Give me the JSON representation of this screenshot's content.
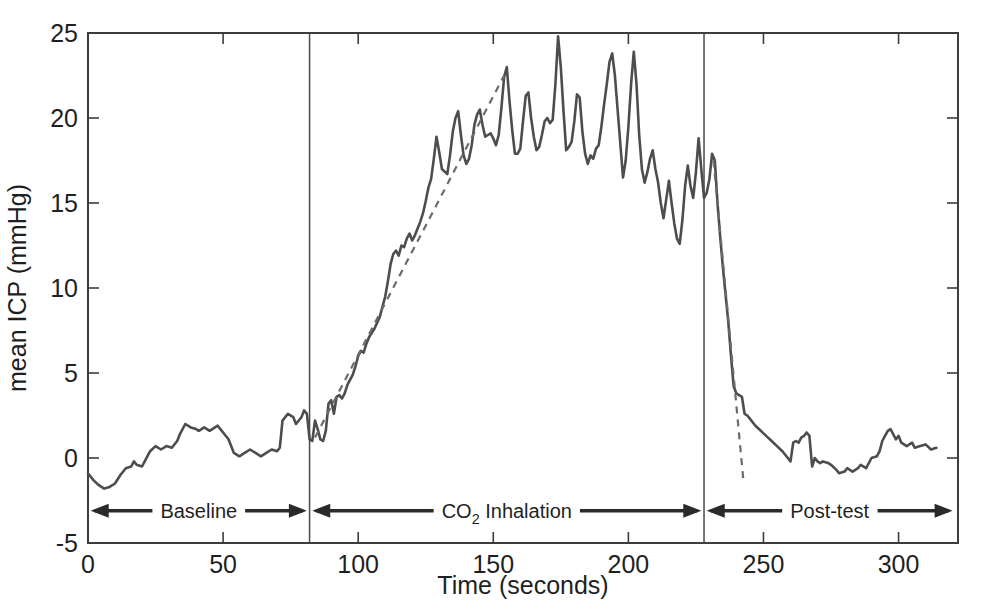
{
  "figure": {
    "background": "#ffffff",
    "line_color": "#4d4d4d",
    "trend_color": "#6b6b6b",
    "axis_color": "#3d3d3d",
    "text_color": "#1f1f1f"
  },
  "chart_data": {
    "type": "line",
    "title": "",
    "xlabel": "Time (seconds)",
    "ylabel": "mean ICP (mmHg)",
    "xlim": [
      0,
      322
    ],
    "ylim": [
      -5,
      25
    ],
    "x_ticks": [
      0,
      50,
      100,
      150,
      200,
      250,
      300
    ],
    "y_ticks": [
      -5,
      0,
      5,
      10,
      15,
      20,
      25
    ],
    "grid": false,
    "box": true,
    "legend": "none",
    "phase_dividers": [
      82,
      228
    ],
    "series": [
      {
        "name": "mean ICP",
        "style": "solid",
        "points": [
          [
            0,
            -0.9
          ],
          [
            2,
            -1.3
          ],
          [
            4,
            -1.6
          ],
          [
            6,
            -1.8
          ],
          [
            8,
            -1.7
          ],
          [
            10,
            -1.5
          ],
          [
            12,
            -1.0
          ],
          [
            14,
            -0.6
          ],
          [
            16,
            -0.5
          ],
          [
            17,
            -0.2
          ],
          [
            18,
            -0.4
          ],
          [
            20,
            -0.5
          ],
          [
            21,
            -0.2
          ],
          [
            23,
            0.4
          ],
          [
            25,
            0.7
          ],
          [
            27,
            0.5
          ],
          [
            29,
            0.7
          ],
          [
            31,
            0.6
          ],
          [
            33,
            1.0
          ],
          [
            34,
            1.4
          ],
          [
            36,
            2.0
          ],
          [
            38,
            1.8
          ],
          [
            40,
            1.7
          ],
          [
            41,
            1.6
          ],
          [
            43,
            1.8
          ],
          [
            45,
            1.6
          ],
          [
            46,
            1.7
          ],
          [
            48,
            1.9
          ],
          [
            49,
            1.7
          ],
          [
            50,
            1.5
          ],
          [
            52,
            1.1
          ],
          [
            54,
            0.3
          ],
          [
            56,
            0.1
          ],
          [
            58,
            0.3
          ],
          [
            60,
            0.5
          ],
          [
            62,
            0.3
          ],
          [
            64,
            0.1
          ],
          [
            66,
            0.3
          ],
          [
            68,
            0.5
          ],
          [
            70,
            0.4
          ],
          [
            71,
            0.6
          ],
          [
            72,
            2.2
          ],
          [
            74,
            2.6
          ],
          [
            76,
            2.4
          ],
          [
            77,
            2.0
          ],
          [
            79,
            2.4
          ],
          [
            80,
            2.8
          ],
          [
            81,
            2.6
          ],
          [
            82,
            1.1
          ],
          [
            83,
            1.0
          ],
          [
            84,
            2.2
          ],
          [
            85,
            1.7
          ],
          [
            86,
            1.1
          ],
          [
            87,
            1.0
          ],
          [
            88,
            1.6
          ],
          [
            89,
            3.2
          ],
          [
            90,
            3.4
          ],
          [
            91,
            2.6
          ],
          [
            92,
            3.6
          ],
          [
            93,
            3.7
          ],
          [
            94,
            3.5
          ],
          [
            95,
            3.8
          ],
          [
            96,
            4.3
          ],
          [
            98,
            4.9
          ],
          [
            99,
            5.4
          ],
          [
            100,
            6.0
          ],
          [
            101,
            6.3
          ],
          [
            102,
            6.2
          ],
          [
            103,
            6.7
          ],
          [
            104,
            7.1
          ],
          [
            106,
            7.6
          ],
          [
            108,
            8.3
          ],
          [
            110,
            9.5
          ],
          [
            111,
            10.4
          ],
          [
            112,
            11.4
          ],
          [
            113,
            12.0
          ],
          [
            114,
            12.2
          ],
          [
            115,
            11.9
          ],
          [
            116,
            12.5
          ],
          [
            117,
            12.4
          ],
          [
            118,
            12.9
          ],
          [
            119,
            13.2
          ],
          [
            120,
            12.8
          ],
          [
            121,
            13.1
          ],
          [
            122,
            13.5
          ],
          [
            123,
            13.9
          ],
          [
            124,
            14.4
          ],
          [
            125,
            15.1
          ],
          [
            126,
            15.9
          ],
          [
            127,
            16.4
          ],
          [
            128,
            17.6
          ],
          [
            129,
            18.9
          ],
          [
            130,
            18.0
          ],
          [
            131,
            17.0
          ],
          [
            133,
            16.7
          ],
          [
            134,
            17.8
          ],
          [
            135,
            19.2
          ],
          [
            136,
            20.0
          ],
          [
            137,
            20.4
          ],
          [
            138,
            19.0
          ],
          [
            139,
            17.8
          ],
          [
            140,
            17.3
          ],
          [
            141,
            17.6
          ],
          [
            142,
            18.4
          ],
          [
            143,
            19.6
          ],
          [
            144,
            20.2
          ],
          [
            145,
            20.5
          ],
          [
            146,
            19.6
          ],
          [
            147,
            18.9
          ],
          [
            148,
            19.0
          ],
          [
            149,
            19.1
          ],
          [
            150,
            18.8
          ],
          [
            151,
            18.4
          ],
          [
            152,
            19.0
          ],
          [
            153,
            20.6
          ],
          [
            154,
            22.4
          ],
          [
            155,
            23.0
          ],
          [
            156,
            21.0
          ],
          [
            157,
            19.3
          ],
          [
            158,
            17.9
          ],
          [
            159,
            17.9
          ],
          [
            160,
            18.2
          ],
          [
            161,
            19.8
          ],
          [
            162,
            21.3
          ],
          [
            163,
            21.5
          ],
          [
            164,
            20.0
          ],
          [
            165,
            18.9
          ],
          [
            166,
            18.1
          ],
          [
            167,
            18.3
          ],
          [
            168,
            19.0
          ],
          [
            169,
            19.8
          ],
          [
            170,
            20.0
          ],
          [
            171,
            19.7
          ],
          [
            172,
            19.9
          ],
          [
            173,
            22.0
          ],
          [
            174,
            24.8
          ],
          [
            175,
            23.0
          ],
          [
            176,
            20.4
          ],
          [
            177,
            18.1
          ],
          [
            178,
            18.3
          ],
          [
            179,
            18.6
          ],
          [
            180,
            19.8
          ],
          [
            181,
            21.4
          ],
          [
            182,
            21.2
          ],
          [
            183,
            19.2
          ],
          [
            184,
            17.9
          ],
          [
            185,
            17.3
          ],
          [
            186,
            17.8
          ],
          [
            187,
            17.6
          ],
          [
            188,
            18.2
          ],
          [
            189,
            18.4
          ],
          [
            190,
            19.5
          ],
          [
            191,
            20.8
          ],
          [
            192,
            22.0
          ],
          [
            193,
            23.3
          ],
          [
            194,
            23.8
          ],
          [
            195,
            22.5
          ],
          [
            196,
            20.5
          ],
          [
            197,
            18.5
          ],
          [
            198,
            16.5
          ],
          [
            199,
            17.5
          ],
          [
            200,
            19.5
          ],
          [
            201,
            22.0
          ],
          [
            202,
            23.9
          ],
          [
            203,
            22.0
          ],
          [
            204,
            19.0
          ],
          [
            205,
            17.0
          ],
          [
            206,
            16.2
          ],
          [
            207,
            16.8
          ],
          [
            208,
            17.6
          ],
          [
            209,
            18.1
          ],
          [
            210,
            17.0
          ],
          [
            211,
            16.2
          ],
          [
            212,
            15.0
          ],
          [
            213,
            14.1
          ],
          [
            214,
            15.2
          ],
          [
            215,
            16.3
          ],
          [
            216,
            15.0
          ],
          [
            217,
            13.8
          ],
          [
            218,
            12.9
          ],
          [
            219,
            12.6
          ],
          [
            220,
            14.0
          ],
          [
            221,
            16.0
          ],
          [
            222,
            17.2
          ],
          [
            223,
            16.0
          ],
          [
            224,
            15.3
          ],
          [
            225,
            16.8
          ],
          [
            226,
            18.8
          ],
          [
            227,
            17.0
          ],
          [
            228,
            15.3
          ],
          [
            229,
            15.6
          ],
          [
            230,
            16.4
          ],
          [
            231,
            17.9
          ],
          [
            232,
            17.5
          ],
          [
            233,
            15.0
          ],
          [
            234,
            13.0
          ],
          [
            235,
            11.2
          ],
          [
            236,
            9.6
          ],
          [
            237,
            8.0
          ],
          [
            238,
            6.0
          ],
          [
            239,
            4.2
          ],
          [
            240,
            3.8
          ],
          [
            241,
            3.7
          ],
          [
            242,
            3.6
          ],
          [
            243,
            2.6
          ],
          [
            244,
            2.5
          ],
          [
            245,
            2.3
          ],
          [
            247,
            1.9
          ],
          [
            249,
            1.6
          ],
          [
            251,
            1.3
          ],
          [
            253,
            1.0
          ],
          [
            255,
            0.7
          ],
          [
            257,
            0.4
          ],
          [
            259,
            0.0
          ],
          [
            260,
            -0.2
          ],
          [
            261,
            0.9
          ],
          [
            262,
            1.0
          ],
          [
            263,
            0.9
          ],
          [
            264,
            1.2
          ],
          [
            265,
            1.3
          ],
          [
            266,
            1.5
          ],
          [
            267,
            1.3
          ],
          [
            268,
            -0.5
          ],
          [
            269,
            0.0
          ],
          [
            270,
            -0.2
          ],
          [
            271,
            -0.3
          ],
          [
            272,
            -0.2
          ],
          [
            274,
            -0.3
          ],
          [
            275,
            -0.4
          ],
          [
            277,
            -0.7
          ],
          [
            278,
            -0.9
          ],
          [
            280,
            -0.8
          ],
          [
            281,
            -0.6
          ],
          [
            283,
            -0.8
          ],
          [
            285,
            -0.6
          ],
          [
            286,
            -0.4
          ],
          [
            288,
            -0.6
          ],
          [
            290,
            0.0
          ],
          [
            292,
            0.1
          ],
          [
            293,
            0.4
          ],
          [
            294,
            1.0
          ],
          [
            295,
            1.3
          ],
          [
            296,
            1.6
          ],
          [
            297,
            1.7
          ],
          [
            298,
            1.4
          ],
          [
            299,
            1.1
          ],
          [
            300,
            1.3
          ],
          [
            301,
            0.9
          ],
          [
            303,
            0.7
          ],
          [
            305,
            0.9
          ],
          [
            306,
            0.6
          ],
          [
            308,
            0.7
          ],
          [
            310,
            0.8
          ],
          [
            312,
            0.5
          ],
          [
            314,
            0.6
          ]
        ]
      },
      {
        "name": "rise trend",
        "style": "dashed",
        "points": [
          [
            84,
            1.2
          ],
          [
            154,
            22.5
          ]
        ]
      },
      {
        "name": "fall trend",
        "style": "dashed",
        "points": [
          [
            231.5,
            17.5
          ],
          [
            242.5,
            -1.2
          ]
        ]
      }
    ],
    "annotations": [
      {
        "label": "Baseline",
        "segments": [
          {
            "t": "Baseline"
          }
        ],
        "from": 1,
        "to": 81,
        "y": -3.1
      },
      {
        "label": "CO2 Inhalation",
        "segments": [
          {
            "t": "CO"
          },
          {
            "t": "2",
            "sub": true
          },
          {
            "t": " Inhalation"
          }
        ],
        "from": 83,
        "to": 227,
        "y": -3.1
      },
      {
        "label": "Post-test",
        "segments": [
          {
            "t": "Post-test"
          }
        ],
        "from": 229,
        "to": 320,
        "y": -3.1
      }
    ]
  }
}
